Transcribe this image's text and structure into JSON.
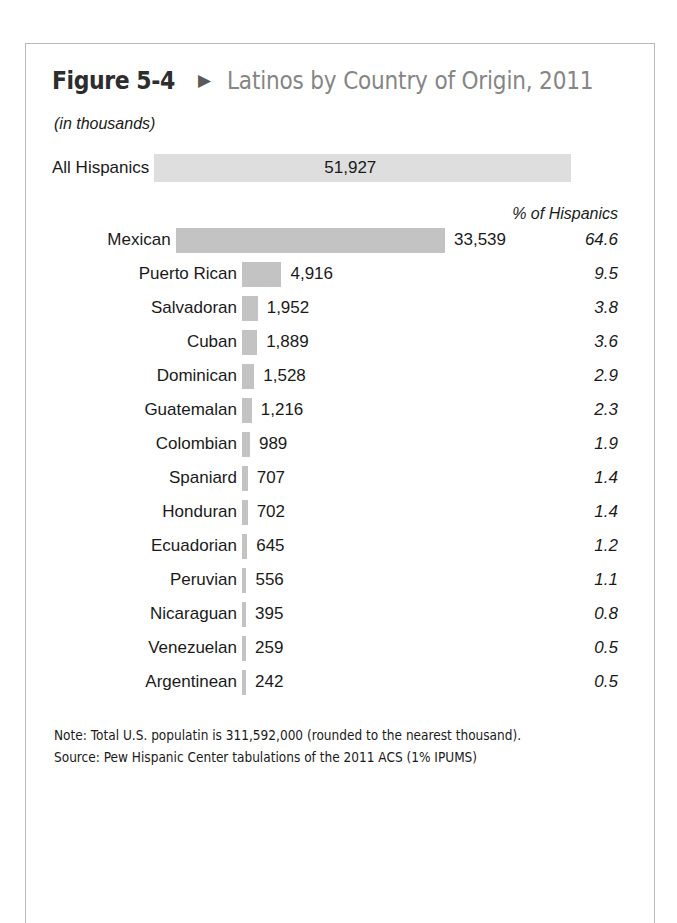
{
  "figure": {
    "number": "Figure 5-4",
    "arrow_icon": "▶",
    "title": "Latinos by Country of Origin, 2011",
    "units": "(in thousands)",
    "pct_header": "% of Hispanics",
    "note": "Note: Total U.S. populatin is 311,592,000 (rounded to the nearest thousand).",
    "source": "Source: Pew Hispanic Center tabulations of the 2011 ACS (1% IPUMS)"
  },
  "colors": {
    "bar": "#c3c3c3",
    "total_bar": "#dedede",
    "border": "#b9b9b9",
    "title_gray": "#858585",
    "text": "#1a1a1a"
  },
  "total": {
    "label": "All Hispanics",
    "value_label": "51,927",
    "value": 51927
  },
  "rows": [
    {
      "label": "Mexican",
      "value_label": "33,539",
      "value": 33539,
      "pct_label": "64.6",
      "pct": 64.6
    },
    {
      "label": "Puerto Rican",
      "value_label": "4,916",
      "value": 4916,
      "pct_label": "9.5",
      "pct": 9.5
    },
    {
      "label": "Salvadoran",
      "value_label": "1,952",
      "value": 1952,
      "pct_label": "3.8",
      "pct": 3.8
    },
    {
      "label": "Cuban",
      "value_label": "1,889",
      "value": 1889,
      "pct_label": "3.6",
      "pct": 3.6
    },
    {
      "label": "Dominican",
      "value_label": "1,528",
      "value": 1528,
      "pct_label": "2.9",
      "pct": 2.9
    },
    {
      "label": "Guatemalan",
      "value_label": "1,216",
      "value": 1216,
      "pct_label": "2.3",
      "pct": 2.3
    },
    {
      "label": "Colombian",
      "value_label": "989",
      "value": 989,
      "pct_label": "1.9",
      "pct": 1.9
    },
    {
      "label": "Spaniard",
      "value_label": "707",
      "value": 707,
      "pct_label": "1.4",
      "pct": 1.4
    },
    {
      "label": "Honduran",
      "value_label": "702",
      "value": 702,
      "pct_label": "1.4",
      "pct": 1.4
    },
    {
      "label": "Ecuadorian",
      "value_label": "645",
      "value": 645,
      "pct_label": "1.2",
      "pct": 1.2
    },
    {
      "label": "Peruvian",
      "value_label": "556",
      "value": 556,
      "pct_label": "1.1",
      "pct": 1.1
    },
    {
      "label": "Nicaraguan",
      "value_label": "395",
      "value": 395,
      "pct_label": "0.8",
      "pct": 0.8
    },
    {
      "label": "Venezuelan",
      "value_label": "259",
      "value": 259,
      "pct_label": "0.5",
      "pct": 0.5
    },
    {
      "label": "Argentinean",
      "value_label": "242",
      "value": 242,
      "pct_label": "0.5",
      "pct": 0.5
    }
  ],
  "chart_data": {
    "type": "bar",
    "orientation": "horizontal",
    "title": "Latinos by Country of Origin, 2011",
    "subtitle": "(in thousands)",
    "xlabel": "",
    "ylabel": "",
    "grid": false,
    "legend": "none",
    "units": "thousands",
    "categories": [
      "All Hispanics",
      "Mexican",
      "Puerto Rican",
      "Salvadoran",
      "Cuban",
      "Dominican",
      "Guatemalan",
      "Colombian",
      "Spaniard",
      "Honduran",
      "Ecuadorian",
      "Peruvian",
      "Nicaraguan",
      "Venezuelan",
      "Argentinean"
    ],
    "values": [
      51927,
      33539,
      4916,
      1952,
      1889,
      1528,
      1216,
      989,
      707,
      702,
      645,
      556,
      395,
      259,
      242
    ],
    "series": [
      {
        "name": "Population (thousands)",
        "values": [
          51927,
          33539,
          4916,
          1952,
          1889,
          1528,
          1216,
          989,
          707,
          702,
          645,
          556,
          395,
          259,
          242
        ]
      },
      {
        "name": "% of Hispanics",
        "values": [
          null,
          64.6,
          9.5,
          3.8,
          3.6,
          2.9,
          2.3,
          1.9,
          1.4,
          1.4,
          1.2,
          1.1,
          0.8,
          0.5,
          0.5
        ]
      }
    ],
    "xlim": [
      0,
      51927
    ],
    "annotations": [
      "Note: Total U.S. populatin is 311,592,000 (rounded to the nearest thousand).",
      "Source: Pew Hispanic Center tabulations of the 2011 ACS (1% IPUMS)"
    ]
  }
}
